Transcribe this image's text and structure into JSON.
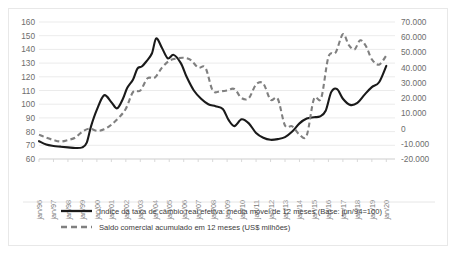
{
  "chart_data": {
    "type": "line",
    "title": "",
    "xlabel": "",
    "ylabel": "",
    "grid": true,
    "legend_position": "bottom-left",
    "categories": [
      "jan/96",
      "jan/97",
      "jan/98",
      "jan/99",
      "jan/00",
      "jan/01",
      "jan/02",
      "jan/03",
      "jan/04",
      "jan/05",
      "jan/06",
      "jan/07",
      "jan/08",
      "jan/09",
      "jan/10",
      "jan/11",
      "jan/12",
      "jan/13",
      "jan/14",
      "jan/15",
      "jan/16",
      "jan/17",
      "jan/18",
      "jan/19",
      "jan/20"
    ],
    "axes": {
      "left": {
        "ticks": [
          60,
          70,
          80,
          90,
          100,
          110,
          120,
          130,
          140,
          150,
          160
        ],
        "min": 60,
        "max": 160,
        "step": 10
      },
      "right": {
        "ticks": [
          "-20.000",
          "-10.000",
          "0",
          "10.000",
          "20.000",
          "30.000",
          "40.000",
          "50.000",
          "60.000",
          "70.000"
        ],
        "min": -20000,
        "max": 70000,
        "step": 10000
      }
    },
    "series": [
      {
        "name": "Índice da taxa de câmbio real efetiva: média móvel de 12 meses (Base: jun/94=100)",
        "style": "solid",
        "color": "#1a1a1a",
        "axis": "left",
        "x": [
          1996.0,
          1996.5,
          1997.0,
          1997.5,
          1998.0,
          1998.5,
          1999.0,
          1999.3,
          1999.6,
          2000.0,
          2000.5,
          2001.0,
          2001.4,
          2001.8,
          2002.1,
          2002.5,
          2002.8,
          2003.1,
          2003.4,
          2003.8,
          2004.1,
          2004.5,
          2004.9,
          2005.3,
          2005.8,
          2006.2,
          2006.7,
          2007.2,
          2007.7,
          2008.2,
          2008.7,
          2009.1,
          2009.5,
          2010.0,
          2010.5,
          2011.0,
          2011.5,
          2012.0,
          2012.5,
          2013.0,
          2013.5,
          2014.0,
          2014.5,
          2015.0,
          2015.4,
          2015.8,
          2016.2,
          2016.6,
          2017.0,
          2017.5,
          2018.0,
          2018.5,
          2019.0,
          2019.5,
          2020.0
        ],
        "y": [
          73.0,
          70.5,
          69.5,
          69.0,
          68.5,
          68.0,
          68.5,
          72.0,
          84.0,
          96.0,
          106.5,
          101.5,
          97.0,
          104.0,
          112.0,
          118.0,
          126.0,
          127.5,
          131.0,
          137.0,
          148.0,
          141.0,
          133.5,
          136.0,
          130.0,
          120.0,
          110.0,
          104.0,
          100.0,
          98.5,
          96.5,
          88.5,
          84.0,
          89.0,
          86.0,
          79.0,
          75.5,
          74.0,
          74.5,
          76.0,
          80.0,
          86.0,
          89.5,
          90.5,
          91.0,
          95.0,
          109.0,
          111.0,
          104.0,
          99.5,
          101.0,
          107.0,
          112.5,
          116.0,
          128.0
        ]
      },
      {
        "name": "Saldo comercial acumulado em 12 meses (US$ milhões)",
        "style": "dashed",
        "color": "#808080",
        "axis": "right",
        "x": [
          1996.0,
          1996.5,
          1997.0,
          1997.5,
          1998.0,
          1998.5,
          1999.0,
          1999.5,
          2000.0,
          2000.5,
          2001.0,
          2001.5,
          2002.0,
          2002.5,
          2003.0,
          2003.5,
          2004.0,
          2004.5,
          2005.0,
          2005.5,
          2006.0,
          2006.5,
          2007.0,
          2007.5,
          2008.0,
          2008.5,
          2009.0,
          2009.5,
          2010.0,
          2010.5,
          2011.0,
          2011.5,
          2012.0,
          2012.5,
          2013.0,
          2013.5,
          2014.0,
          2014.5,
          2015.0,
          2015.5,
          2016.0,
          2016.5,
          2017.0,
          2017.4,
          2017.8,
          2018.2,
          2018.6,
          2019.0,
          2019.5,
          2020.0
        ],
        "y": [
          -4000,
          -6000,
          -7500,
          -8500,
          -7500,
          -6000,
          -2000,
          0,
          -1500,
          -500,
          2500,
          7000,
          13000,
          24000,
          25000,
          33000,
          33500,
          40000,
          44500,
          46000,
          46500,
          45000,
          40000,
          40000,
          25000,
          24500,
          25000,
          26000,
          20000,
          20000,
          29000,
          29500,
          19000,
          19500,
          2000,
          1500,
          -4000,
          -4500,
          19500,
          20000,
          47000,
          50000,
          62000,
          55000,
          52000,
          58000,
          54000,
          45500,
          42000,
          48000
        ]
      }
    ]
  },
  "legend": {
    "entries": [
      {
        "label": "Índice da taxa de câmbio real efetiva: média móvel de 12 meses (Base: jun/94=100)",
        "style": "solid"
      },
      {
        "label": "Saldo comercial acumulado em 12 meses (US$ milhões)",
        "style": "dashed"
      }
    ]
  }
}
